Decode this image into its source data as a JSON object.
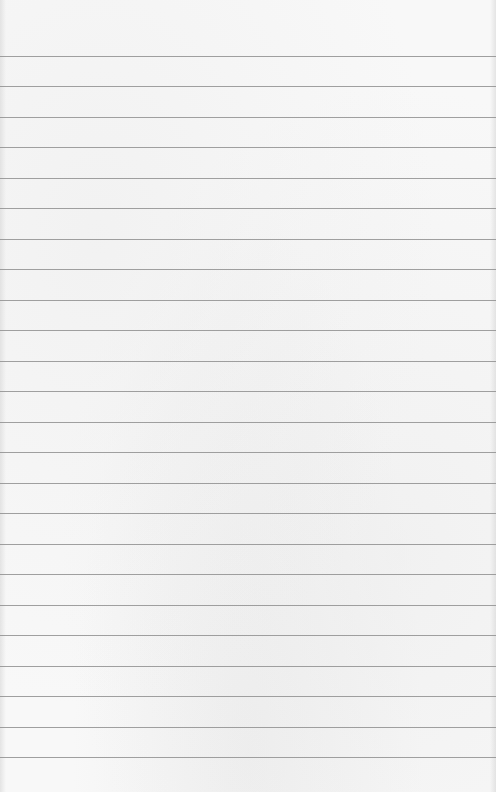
{
  "paper": {
    "width": 496,
    "height": 792,
    "background_color": "#f8f8f8",
    "rule_color": "#8f8f8f",
    "first_rule_y": 56,
    "rule_spacing": 30.48,
    "rule_count": 24
  }
}
